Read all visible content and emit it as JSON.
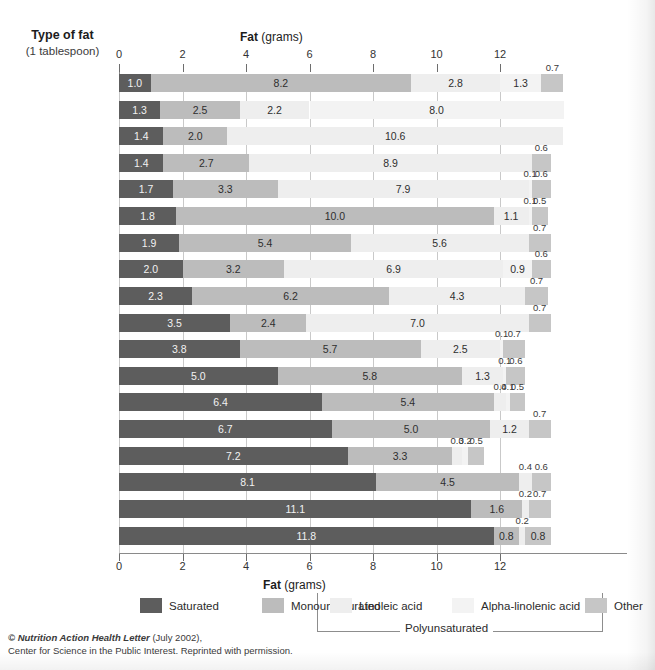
{
  "header": {
    "left_title_line1": "Type of fat",
    "left_title_line2": "(1 tablespoon)",
    "axis_title_bold": "Fat",
    "axis_title_rest": " (grams)"
  },
  "credit": {
    "line1_italic": "© Nutrition Action Health Letter",
    "line1_rest": " (July 2002),",
    "line2": "Center for Science in the Public Interest. Reprinted with permission."
  },
  "legend": {
    "items": [
      {
        "label": "Saturated",
        "color": "#5d5d5d"
      },
      {
        "label": "Monounsaturated",
        "color": "#bcbcbc"
      },
      {
        "label": "Linoleic acid",
        "color": "#eeeeee"
      },
      {
        "label": "Alpha-linolenic acid",
        "color": "#f3f3f3"
      },
      {
        "label": "Other",
        "color": "#c6c6c6"
      }
    ],
    "bracket_label": "Polyunsaturated"
  },
  "chart_data": {
    "type": "bar",
    "orientation": "horizontal",
    "stacked": true,
    "title": "Fat (grams)",
    "xlabel": "Fat (grams)",
    "ylabel": "Type of fat (1 tablespoon)",
    "xlim": [
      0,
      15.6
    ],
    "xticks": [
      0,
      2,
      4,
      6,
      8,
      10,
      12
    ],
    "xticklabels": [
      "0",
      "2",
      "4",
      "6",
      "8",
      "10",
      "12"
    ],
    "grid": true,
    "legend_position": "bottom",
    "series": [
      {
        "name": "Saturated",
        "color": "#5d5d5d"
      },
      {
        "name": "Monounsaturated",
        "color": "#bcbcbc"
      },
      {
        "name": "Linoleic acid",
        "color": "#eeeeee"
      },
      {
        "name": "Alpha-linolenic acid",
        "color": "#f3f3f3"
      },
      {
        "name": "Other",
        "color": "#c6c6c6"
      }
    ],
    "categories": [
      "Canola oil",
      "Flaxseed oil",
      "Safflower oil",
      "Sunflower oil",
      "Corn oil",
      "Olive oil",
      "Sesame oil",
      "Soybean oil",
      "Peanut oil",
      "Cottonseed oil",
      "Chicken fat",
      "Lard (pork fat)",
      "Beef tallow",
      "Palm oil",
      "Butter",
      "Cocoa butter",
      "Palm kernel oil",
      "Coconut oil"
    ],
    "rows": [
      {
        "name": "Canola oil",
        "saturated": 1.0,
        "mono": 8.2,
        "linoleic": 2.8,
        "alpha": 1.3,
        "other": 0.7
      },
      {
        "name": "Flaxseed oil",
        "saturated": 1.3,
        "mono": 2.5,
        "linoleic": 2.2,
        "alpha": 8.0,
        "other": 0.0
      },
      {
        "name": "Safflower oil",
        "saturated": 1.4,
        "mono": 2.0,
        "linoleic": 10.6,
        "alpha": 0.0,
        "other": 0.0
      },
      {
        "name": "Sunflower oil",
        "saturated": 1.4,
        "mono": 2.7,
        "linoleic": 8.9,
        "alpha": 0.0,
        "other": 0.6
      },
      {
        "name": "Corn oil",
        "saturated": 1.7,
        "mono": 3.3,
        "linoleic": 7.9,
        "alpha": 0.1,
        "other": 0.6
      },
      {
        "name": "Olive oil",
        "saturated": 1.8,
        "mono": 10.0,
        "linoleic": 1.1,
        "alpha": 0.1,
        "other": 0.5
      },
      {
        "name": "Sesame oil",
        "saturated": 1.9,
        "mono": 5.4,
        "linoleic": 5.6,
        "alpha": 0.0,
        "other": 0.7
      },
      {
        "name": "Soybean oil",
        "saturated": 2.0,
        "mono": 3.2,
        "linoleic": 6.9,
        "alpha": 0.9,
        "other": 0.6
      },
      {
        "name": "Peanut oil",
        "saturated": 2.3,
        "mono": 6.2,
        "linoleic": 4.3,
        "alpha": 0.0,
        "other": 0.7
      },
      {
        "name": "Cottonseed oil",
        "saturated": 3.5,
        "mono": 2.4,
        "linoleic": 7.0,
        "alpha": 0.0,
        "other": 0.7
      },
      {
        "name": "Chicken fat",
        "saturated": 3.8,
        "mono": 5.7,
        "linoleic": 2.5,
        "alpha": 0.1,
        "other": 0.7
      },
      {
        "name": "Lard (pork fat)",
        "saturated": 5.0,
        "mono": 5.8,
        "linoleic": 1.3,
        "alpha": 0.1,
        "other": 0.6
      },
      {
        "name": "Beef tallow",
        "saturated": 6.4,
        "mono": 5.4,
        "linoleic": 0.4,
        "alpha": 0.1,
        "other": 0.5
      },
      {
        "name": "Palm oil",
        "saturated": 6.7,
        "mono": 5.0,
        "linoleic": 1.2,
        "alpha": 0.0,
        "other": 0.7
      },
      {
        "name": "Butter",
        "saturated": 7.2,
        "mono": 3.3,
        "linoleic": 0.3,
        "alpha": 0.2,
        "other": 0.5
      },
      {
        "name": "Cocoa butter",
        "saturated": 8.1,
        "mono": 4.5,
        "linoleic": 0.4,
        "alpha": 0.0,
        "other": 0.6
      },
      {
        "name": "Palm kernel oil",
        "saturated": 11.1,
        "mono": 1.6,
        "linoleic": 0.2,
        "alpha": 0.0,
        "other": 0.7
      },
      {
        "name": "Coconut oil",
        "saturated": 11.8,
        "mono": 0.8,
        "linoleic": 0.2,
        "alpha": 0.0,
        "other": 0.8
      }
    ]
  }
}
